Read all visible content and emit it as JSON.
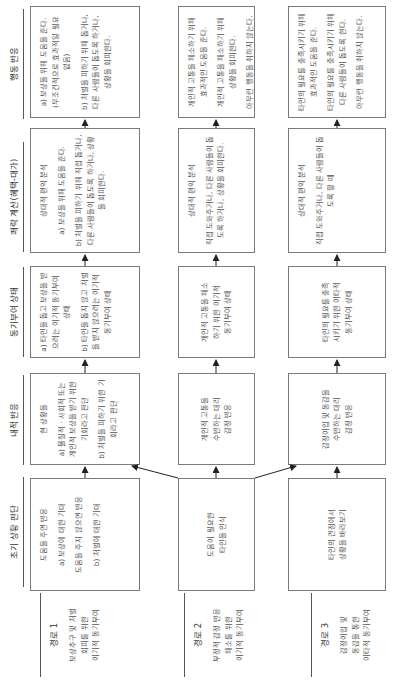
{
  "headers": {
    "initial": "초기 상황 판단",
    "internal": "내적 반응",
    "motivation": "동기부여 상태",
    "calculation": "쾌락 계산(혜택-대가)",
    "action": "행동 반응"
  },
  "routes": [
    {
      "title": "경로 1",
      "desc": [
        "보상추구 및 처벌",
        "회피를 위한",
        "이기적 동기부여"
      ],
      "initial": [
        "도움을 주면 반응",
        "a) 보상에 대한 기대",
        "도움을 주지 않으면 반응",
        "b) 처벌에 대한 기대"
      ],
      "internal": [
        "현 상황을",
        "a) 물질적 · 사회적 또는 개인적 보상을 받기 위한 기회라고 판단",
        "b) 처벌을 피하기 위한 기회라고 판단"
      ],
      "motivation": [
        "a) 타인을 돕고 보상을 받으려는 이기적 동기부여 상태",
        "b) 타인을 돕지 않고 처벌을 받지 않으려는 이기적 동기부여 상태"
      ],
      "calculation": [
        "상대적 편익 분석",
        "a) 보상을 위해 도움을 준다.",
        "b) 처벌을 피하기 위해 직접 돕거나, 다른 사람들이 돕도록 하거나, 상황을 회피한다."
      ],
      "action": [
        "a) 보상을 위해 도움을 준다. (무조건적으로 효과적일 필요 없음)",
        "b) 처벌을 피하기 위해 돕거나, 다른 사람들이 돕도록 하거나, 상황을 회피한다."
      ]
    },
    {
      "title": "경로 2",
      "desc": [
        "부정적 감정 반응",
        "해소를 위한",
        "이기적 동기부여"
      ],
      "initial": [
        "도움이 필요한",
        "타인을 인식"
      ],
      "internal": [
        "개인적 고통을",
        "수반하는 대리",
        "감정 반응"
      ],
      "motivation": [
        "개인적 고통을 해소",
        "하기 위한 이기적",
        "동기부여 상태"
      ],
      "calculation": [
        "상대적 편익 분석",
        "직접 도와주거나, 다른 사람들이 돕도록 하거나, 상황을 회피한다."
      ],
      "action": [
        "개인적 고통을 해소하기 위해 효과적인 도움을 준다.",
        "개인적 고통을 해소하기 위해 상황을 회피한다.",
        "아무런 행동을 취하지 않는다."
      ]
    },
    {
      "title": "경로 3",
      "desc": [
        "감정이입 및",
        "동감을 통한",
        "이타적 동기부여"
      ],
      "initial": [
        "타인의 관점에서",
        "상황을 바라보기"
      ],
      "internal": [
        "감정이입 및 동감을",
        "수반하는 대리",
        "감정 반응"
      ],
      "motivation": [
        "타인의 필요를 충족",
        "시키기 위한 이타적",
        "동기부여 상태"
      ],
      "calculation": [
        "상대적 편익 분석",
        "직접 도와주거나, 다른 사람들이 돕도록 할 때"
      ],
      "action": [
        "타인의 필요를 충족시키기 위해 효과적인 도움을 준다.",
        "타인의 필요를 충족시키기 위해 다른 사람들이 돕도록 한다.",
        "아무런 행동을 취하지 않는다."
      ]
    }
  ],
  "colors": {
    "line": "#7a7a7a",
    "text": "#555555",
    "arrow": "#222222"
  }
}
